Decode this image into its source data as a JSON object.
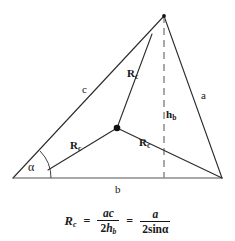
{
  "figure": {
    "type": "geometry-diagram",
    "colors": {
      "stroke": "#2b2b2b",
      "dashed_stroke": "#8c8c8c",
      "text": "#151515",
      "background": "#ffffff",
      "vertex_dot": "#111111"
    },
    "geometry": {
      "vertices": {
        "left": [
          13,
          178
        ],
        "apex": [
          164,
          16
        ],
        "right": [
          222,
          178
        ]
      },
      "circumcenter": [
        117,
        128
      ],
      "foot_of_height": [
        164,
        178
      ],
      "angle_alpha_arc_radius": 30
    },
    "labels": {
      "side_c": "c",
      "side_a": "a",
      "side_b": "b",
      "angle": "α",
      "height": "h",
      "height_sub": "b",
      "radius": "R",
      "radius_sub": "c"
    },
    "formula": {
      "lhs": "R",
      "lhs_sub": "c",
      "equals_1": "=",
      "frac1_num": "ac",
      "frac1_den_coeff": "2",
      "frac1_den_var": "h",
      "frac1_den_sub": "b",
      "equals_2": "=",
      "frac2_num": "a",
      "frac2_den_coeff": "2",
      "frac2_den_fn": "sin",
      "frac2_den_angle": "α"
    }
  }
}
